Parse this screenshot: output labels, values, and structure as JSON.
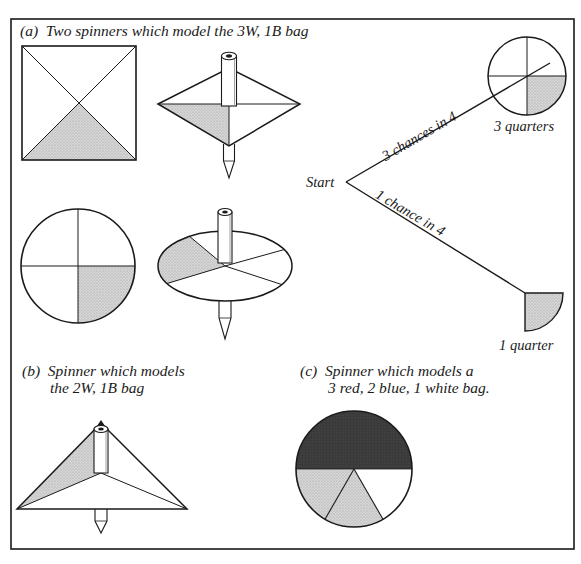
{
  "colors": {
    "ink": "#1a1a1a",
    "stipple": "#cfcfcf",
    "dark": "#333333",
    "paper": "#ffffff"
  },
  "frame": {
    "x": 11,
    "y": 19,
    "w": 563,
    "h": 530
  },
  "section_a": {
    "label": "(a)",
    "caption": "Two spinners which model the 3W, 1B bag",
    "square_spinner": {
      "x": 22,
      "y": 46,
      "size": 114,
      "shaded_quarter": "bottom"
    },
    "diamond_top": {
      "cx": 229,
      "cy": 104,
      "half_w": 71,
      "up": 36,
      "down": 42,
      "shaded_quarter": "front-left"
    },
    "circle_spinner": {
      "cx": 78,
      "cy": 266,
      "r": 57,
      "shaded_quarter": "bottom-right"
    },
    "disc_top": {
      "cx": 225,
      "cy": 266,
      "rx": 67,
      "ry": 35,
      "shaded_quarter": "left"
    }
  },
  "tree": {
    "start_label": "Start",
    "start": {
      "x": 346,
      "y": 182
    },
    "branch_upper": {
      "label": "3 chances in 4",
      "end_x": 550,
      "end_y": 63
    },
    "branch_lower": {
      "label": "1 chance in 4",
      "end_x": 525,
      "end_y": 293
    },
    "outcome_upper": {
      "label": "3 quarters",
      "cx": 527,
      "cy": 76,
      "r": 39
    },
    "outcome_lower": {
      "label": "1 quarter",
      "x": 525,
      "y": 293,
      "r": 38
    }
  },
  "section_b": {
    "label": "(b)",
    "caption_line1": "Spinner which models",
    "caption_line2": "the 2W, 1B bag",
    "triangle_top": {
      "apex_x": 101,
      "apex_y": 423,
      "left_x": 17,
      "right_x": 187,
      "base_y": 509,
      "inner_y": 473
    }
  },
  "section_c": {
    "label": "(c)",
    "caption_line1": "Spinner which models a",
    "caption_line2": "3 red, 2 blue, 1 white bag.",
    "pie": {
      "cx": 354,
      "cy": 469,
      "r": 58,
      "segments": [
        {
          "name": "red",
          "count": 3,
          "fill": "dark"
        },
        {
          "name": "blue",
          "count": 2,
          "fill": "stipple"
        },
        {
          "name": "white",
          "count": 1,
          "fill": "paper"
        }
      ]
    }
  }
}
